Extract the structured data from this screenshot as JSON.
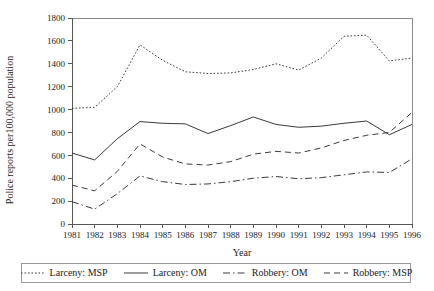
{
  "chart_data": {
    "type": "line",
    "title": "",
    "xlabel": "Year",
    "ylabel": "Police reports per100,000 population",
    "x": [
      1981,
      1982,
      1983,
      1984,
      1985,
      1986,
      1987,
      1988,
      1989,
      1990,
      1991,
      1992,
      1993,
      1994,
      1995,
      1996
    ],
    "categories": [
      "1981",
      "1982",
      "1983",
      "1984",
      "1985",
      "1986",
      "1987",
      "1988",
      "1989",
      "1990",
      "1991",
      "1992",
      "1993",
      "1994",
      "1995",
      "1996"
    ],
    "xlim": [
      1981,
      1996
    ],
    "ylim": [
      0,
      1800
    ],
    "yticks": [
      0,
      200,
      400,
      600,
      800,
      1000,
      1200,
      1400,
      1600,
      1800
    ],
    "grid": false,
    "legend_position": "bottom",
    "series": [
      {
        "name": "Larceny: MSP",
        "style": "dotted",
        "values": [
          1010,
          1020,
          1200,
          1565,
          1430,
          1330,
          1315,
          1320,
          1350,
          1400,
          1345,
          1450,
          1640,
          1650,
          1425,
          1450
        ]
      },
      {
        "name": "Larceny: OM",
        "style": "solid",
        "values": [
          620,
          560,
          745,
          895,
          880,
          875,
          790,
          860,
          935,
          870,
          845,
          855,
          880,
          900,
          780,
          870
        ]
      },
      {
        "name": "Robbery: OM",
        "style": "dashdot",
        "values": [
          195,
          130,
          265,
          420,
          370,
          345,
          350,
          370,
          400,
          415,
          395,
          405,
          430,
          455,
          450,
          570
        ]
      },
      {
        "name": "Robbery: MSP",
        "style": "dashed",
        "values": [
          340,
          290,
          460,
          700,
          585,
          525,
          515,
          545,
          610,
          635,
          620,
          665,
          730,
          775,
          800,
          975
        ]
      }
    ]
  },
  "axis": {
    "y_title": "Police reports per100,000 population",
    "x_title": "Year"
  },
  "legend": {
    "items": [
      {
        "label": "Larceny: MSP",
        "style": "dotted"
      },
      {
        "label": "Larceny: OM",
        "style": "solid"
      },
      {
        "label": "Robbery: OM",
        "style": "dashdot"
      },
      {
        "label": "Robbery: MSP",
        "style": "dashed"
      }
    ]
  }
}
